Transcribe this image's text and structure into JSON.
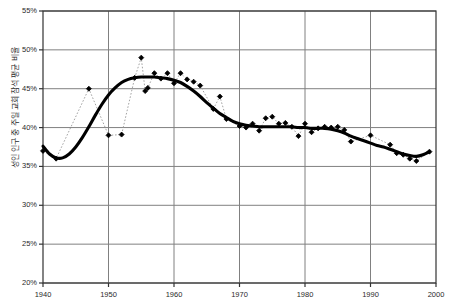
{
  "chart_data": {
    "type": "scatter",
    "title": "",
    "subtitle": "",
    "xlabel": "",
    "ylabel": "성인 인구 중 주일 교회 참석 평균 비율",
    "xlim": [
      1940,
      2000
    ],
    "ylim": [
      20,
      55
    ],
    "xticks": [
      1940,
      1950,
      1960,
      1970,
      1980,
      1990,
      2000
    ],
    "yticks": [
      20,
      25,
      30,
      35,
      40,
      45,
      50,
      55
    ],
    "ytick_labels": [
      "20%",
      "25%",
      "30%",
      "35%",
      "40%",
      "45%",
      "50%",
      "55%"
    ],
    "xtick_labels": [
      "1940",
      "1950",
      "1960",
      "1970",
      "1980",
      "1990",
      "2000"
    ],
    "grid": true,
    "grid_color": "#808080",
    "axis_color": "#333333",
    "legend": false,
    "legend_position": "none",
    "y_unit": "percent",
    "marker_color": "#000000",
    "marker_shape": "diamond",
    "connector_style": "dotted",
    "connector_color": "#999999",
    "trend_color": "#000000",
    "trend_style": "solid-thick",
    "series": [
      {
        "name": "연도별 관측치",
        "type": "scatter",
        "x": [
          1940,
          1942,
          1947,
          1950,
          1952,
          1954,
          1955,
          1955.6,
          1956,
          1957,
          1958,
          1959,
          1960,
          1961,
          1962,
          1963,
          1964,
          1966,
          1967,
          1968,
          1970,
          1971,
          1972,
          1973,
          1974,
          1975,
          1976,
          1977,
          1978,
          1979,
          1980,
          1981,
          1982,
          1983,
          1984,
          1985,
          1986,
          1987,
          1990,
          1993,
          1994,
          1995,
          1996,
          1997,
          1999
        ],
        "values": [
          37.0,
          36.0,
          45.0,
          39.0,
          39.1,
          46.4,
          49.0,
          44.7,
          45.1,
          47.0,
          46.3,
          47.0,
          45.7,
          47.0,
          46.2,
          45.9,
          45.4,
          42.4,
          44.0,
          41.1,
          40.2,
          40.0,
          40.5,
          39.6,
          41.2,
          41.4,
          40.5,
          40.6,
          40.1,
          38.9,
          40.5,
          39.4,
          39.9,
          40.1,
          40.0,
          40.1,
          39.7,
          38.2,
          39.0,
          37.8,
          36.7,
          36.5,
          36.0,
          35.7,
          36.9
        ]
      },
      {
        "name": "추세선",
        "type": "line",
        "x": [
          1940,
          1941,
          1942,
          1943,
          1944,
          1945,
          1946,
          1947,
          1948,
          1949,
          1950,
          1951,
          1952,
          1953,
          1954,
          1955,
          1956,
          1957,
          1958,
          1959,
          1960,
          1961,
          1962,
          1963,
          1964,
          1965,
          1966,
          1967,
          1968,
          1969,
          1970,
          1971,
          1972,
          1973,
          1974,
          1975,
          1976,
          1977,
          1978,
          1979,
          1980,
          1981,
          1982,
          1983,
          1984,
          1985,
          1986,
          1987,
          1988,
          1989,
          1990,
          1991,
          1992,
          1993,
          1994,
          1995,
          1996,
          1997,
          1998,
          1999
        ],
        "values": [
          37.6,
          36.6,
          36.1,
          36.1,
          36.6,
          37.5,
          38.7,
          40.1,
          41.6,
          43.0,
          44.2,
          45.1,
          45.8,
          46.2,
          46.4,
          46.5,
          46.5,
          46.5,
          46.4,
          46.3,
          46.1,
          45.8,
          45.3,
          44.7,
          44.0,
          43.2,
          42.5,
          41.8,
          41.3,
          40.8,
          40.5,
          40.3,
          40.2,
          40.1,
          40.1,
          40.1,
          40.1,
          40.1,
          40.1,
          40.0,
          40.0,
          39.9,
          39.9,
          39.9,
          39.8,
          39.6,
          39.3,
          38.9,
          38.6,
          38.3,
          38.0,
          37.7,
          37.5,
          37.2,
          36.9,
          36.6,
          36.4,
          36.3,
          36.5,
          36.9
        ]
      }
    ]
  }
}
